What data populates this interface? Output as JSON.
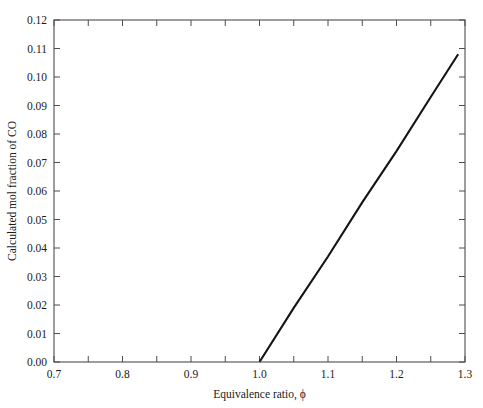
{
  "chart_data": {
    "type": "line",
    "title": "",
    "xlabel": "Equivalence ratio, ϕ",
    "ylabel": "Calculated mol fraction of CO",
    "xlim": [
      0.7,
      1.3
    ],
    "ylim": [
      0.0,
      0.12
    ],
    "grid": false,
    "legend": null,
    "x_ticks": [
      0.7,
      0.8,
      0.9,
      1.0,
      1.1,
      1.2,
      1.3
    ],
    "x_tick_labels": [
      "0.7",
      "0.8",
      "0.9",
      "1.0",
      "1.1",
      "1.2",
      "1.3"
    ],
    "x_minor_tick_step": 0.05,
    "y_ticks": [
      0.0,
      0.01,
      0.02,
      0.03,
      0.04,
      0.05,
      0.06,
      0.07,
      0.08,
      0.09,
      0.1,
      0.11,
      0.12
    ],
    "y_tick_labels": [
      "0.00",
      "0.01",
      "0.02",
      "0.03",
      "0.04",
      "0.05",
      "0.06",
      "0.07",
      "0.08",
      "0.09",
      "0.10",
      "0.11",
      "0.12"
    ],
    "series": [
      {
        "name": "Calculated mol fraction of CO",
        "color": "#141414",
        "x": [
          1.0,
          1.05,
          1.1,
          1.15,
          1.2,
          1.25,
          1.29
        ],
        "values": [
          0.0,
          0.019,
          0.037,
          0.056,
          0.074,
          0.093,
          0.108
        ]
      }
    ],
    "annotations": []
  },
  "axes": {
    "x_axis_title": "Equivalence ratio, ϕ",
    "y_axis_title": "Calculated mol fraction of CO"
  }
}
